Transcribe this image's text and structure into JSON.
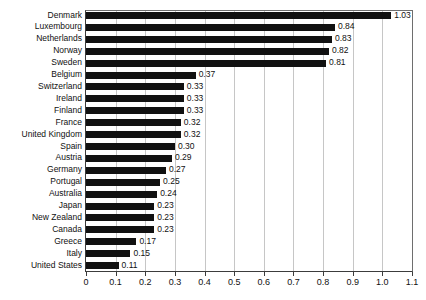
{
  "chart_data": {
    "type": "bar",
    "orientation": "horizontal",
    "title": "",
    "subtitle": "",
    "xlabel": "",
    "ylabel": "",
    "xlim": [
      0,
      1.1
    ],
    "ylim": null,
    "grid": "vertical",
    "legend": null,
    "bar_color": "#111111",
    "gridline_color": "#c6c6c6",
    "background_color": "#ffffff",
    "xticks": [
      "0",
      "0.1",
      "0.2",
      "0.3",
      "0.4",
      "0.5",
      "0.6",
      "0.7",
      "0.8",
      "0.9",
      "1.0",
      "1.1"
    ],
    "xtick_values": [
      0,
      0.1,
      0.2,
      0.3,
      0.4,
      0.5,
      0.6,
      0.7,
      0.8,
      0.9,
      1.0,
      1.1
    ],
    "categories": [
      "Denmark",
      "Luxembourg",
      "Netherlands",
      "Norway",
      "Sweden",
      "Belgium",
      "Switzerland",
      "Ireland",
      "Finland",
      "France",
      "United Kingdom",
      "Spain",
      "Austria",
      "Germany",
      "Portugal",
      "Australia",
      "Japan",
      "New Zealand",
      "Canada",
      "Greece",
      "Italy",
      "United States"
    ],
    "values": [
      1.03,
      0.84,
      0.83,
      0.82,
      0.81,
      0.37,
      0.33,
      0.33,
      0.33,
      0.32,
      0.32,
      0.3,
      0.29,
      0.27,
      0.25,
      0.24,
      0.23,
      0.23,
      0.23,
      0.17,
      0.15,
      0.11
    ],
    "value_labels": [
      "1.03",
      "0.84",
      "0.83",
      "0.82",
      "0.81",
      "0.37",
      "0.33",
      "0.33",
      "0.33",
      "0.32",
      "0.32",
      "0.30",
      "0.29",
      "0.27",
      "0.25",
      "0.24",
      "0.23",
      "0.23",
      "0.23",
      "0.17",
      "0.15",
      "0.11"
    ]
  }
}
